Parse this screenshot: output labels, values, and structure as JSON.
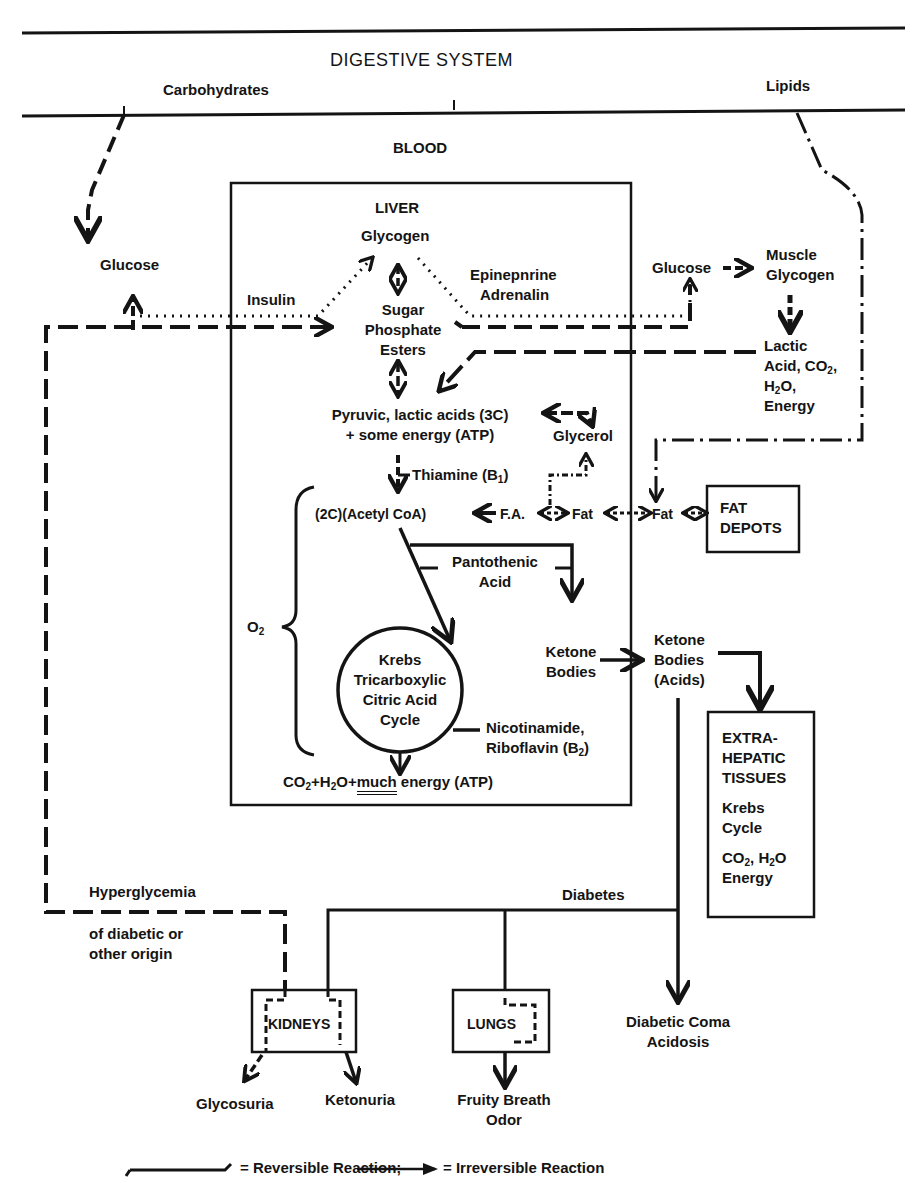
{
  "title": "DIGESTIVE SYSTEM",
  "inputs": {
    "carbohydrates": "Carbohydrates",
    "lipids": "Lipids"
  },
  "blood": "BLOOD",
  "blood_glucose": "Glucose",
  "liver": {
    "title": "LIVER",
    "glycogen": "Glycogen",
    "insulin": "Insulin",
    "epinephrine_line1": "Epinepnrine",
    "epinephrine_line2": "Adrenalin",
    "sugar_phosphate": [
      "Sugar",
      "Phosphate",
      "Esters"
    ],
    "pyruvic_line1": "Pyruvic, lactic acids (3C)",
    "pyruvic_line2": "+ some energy (ATP)",
    "glycerol": "Glycerol",
    "thiamine": "Thiamine (B",
    "thiamine_sub": "1",
    "thiamine_close": ")",
    "acetyl_coa": "(2C)(Acetyl CoA)",
    "fatty_acid": "F.A.",
    "fat": "Fat",
    "pantothenic": [
      "Pantothenic",
      "Acid"
    ],
    "oxygen": "O",
    "oxygen_sub": "2",
    "krebs": [
      "Krebs",
      "Tricarboxylic",
      "Citric Acid",
      "Cycle"
    ],
    "ketone_bodies": [
      "Ketone",
      "Bodies"
    ],
    "nicotinamide": "Nicotinamide,",
    "riboflavin": "Riboflavin (B",
    "riboflavin_sub": "2",
    "riboflavin_close": ")",
    "products_pre": "CO",
    "products_sub1": "2",
    "products_mid1": "+H",
    "products_sub2": "2",
    "products_mid2": "O+",
    "products_much": "much",
    "products_post": " energy (ATP)"
  },
  "muscle": {
    "glucose": "Glucose",
    "muscle_glycogen": [
      "Muscle",
      "Glycogen"
    ],
    "lactic_line1": "Lactic",
    "lactic_line2": "Acid, CO",
    "lactic_line2_sub": "2",
    "lactic_line2_end": ",",
    "lactic_line3": "H",
    "lactic_line3_sub": "2",
    "lactic_line3_end": "O,",
    "lactic_line4": "Energy"
  },
  "fat_blood": "Fat",
  "fat_depots": [
    "FAT",
    "DEPOTS"
  ],
  "ketone_acids": [
    "Ketone",
    "Bodies",
    "(Acids)"
  ],
  "extrahepatic": {
    "title": [
      "EXTRA-",
      "HEPATIC",
      "TISSUES"
    ],
    "krebs": [
      "Krebs",
      "Cycle"
    ],
    "products_line1_a": "CO",
    "products_line1_sub1": "2",
    "products_line1_b": ", H",
    "products_line1_sub2": "2",
    "products_line1_c": "O",
    "products_line2": "Energy"
  },
  "hyperglycemia": [
    "Hyperglycemia",
    "of diabetic or",
    "other origin"
  ],
  "diabetes": "Diabetes",
  "kidneys": "KIDNEYS",
  "lungs": "LUNGS",
  "outcomes": {
    "glycosuria": "Glycosuria",
    "ketonuria": "Ketonuria",
    "fruity_breath": [
      "Fruity Breath",
      "Odor"
    ],
    "diabetic_coma": [
      "Diabetic Coma",
      "Acidosis"
    ]
  },
  "legend": {
    "reversible": "= Reversible Reaction;",
    "irreversible": "= Irreversible Reaction"
  },
  "colors": {
    "ink": "#141414",
    "background": "#ffffff"
  }
}
